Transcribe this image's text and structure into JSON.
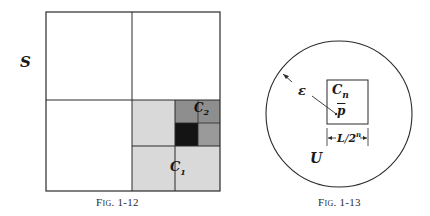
{
  "figures": [
    {
      "id": "fig-1-12",
      "caption": "Fig. 1-12",
      "labels": {
        "set": "S",
        "cube1": "C",
        "cube1_sub": "1",
        "cube2": "C",
        "cube2_sub": "2"
      },
      "colors": {
        "border": "#2a2a2a",
        "light_shade": "#d6d6d6",
        "medium_shade": "#8f8f8f",
        "dark_shade": "#151515"
      }
    },
    {
      "id": "fig-1-13",
      "caption": "Fig. 1-13",
      "labels": {
        "cube": "C",
        "cube_sub": "n",
        "point": "p",
        "epsilon": "ε",
        "set": "U",
        "side_length": "L",
        "side_divisor": "2",
        "side_exp": "n"
      }
    }
  ]
}
